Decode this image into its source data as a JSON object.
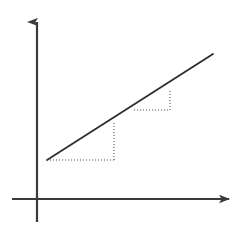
{
  "figure": {
    "name": "slope-of-a-straight-line-diagram",
    "background_color": "#ffffff",
    "width": 242,
    "height": 240
  },
  "chart_data": {
    "type": "line",
    "title": "",
    "xlabel": "",
    "ylabel": "",
    "grid": false,
    "legend": null,
    "axis_style": {
      "color": "#3a3a3a",
      "stroke_width": 2.2,
      "arrowheads": [
        "x-axis-right",
        "y-axis-up"
      ]
    },
    "axes": {
      "origin_px": [
        37,
        199
      ],
      "x_axis_px": {
        "from": [
          12,
          199
        ],
        "to": [
          232,
          199
        ]
      },
      "y_axis_px": {
        "from": [
          37,
          222
        ],
        "to": [
          37,
          12
        ]
      }
    },
    "series": [
      {
        "name": "straight-line",
        "color": "#2e2e2e",
        "stroke_width": 1.8,
        "style": "solid",
        "points_px": [
          [
            47,
            160
          ],
          [
            213,
            54
          ]
        ]
      }
    ],
    "annotations": [
      {
        "name": "slope-triangle-1",
        "style": "dotted",
        "color": "#555555",
        "run_px": {
          "from": [
            47,
            160
          ],
          "to": [
            114,
            160
          ]
        },
        "rise_px": {
          "from": [
            114,
            160
          ],
          "to": [
            114,
            121
          ]
        },
        "vertex_on_line_px": [
          114,
          121
        ]
      },
      {
        "name": "slope-triangle-2",
        "style": "dotted",
        "color": "#555555",
        "run_px": {
          "from": [
            134,
            110
          ],
          "to": [
            170,
            110
          ]
        },
        "rise_px": {
          "from": [
            170,
            110
          ],
          "to": [
            170,
            91
          ]
        },
        "vertex_on_line_px": [
          170,
          91
        ]
      }
    ],
    "x": [
      47,
      213
    ],
    "values": [
      160,
      54
    ]
  }
}
